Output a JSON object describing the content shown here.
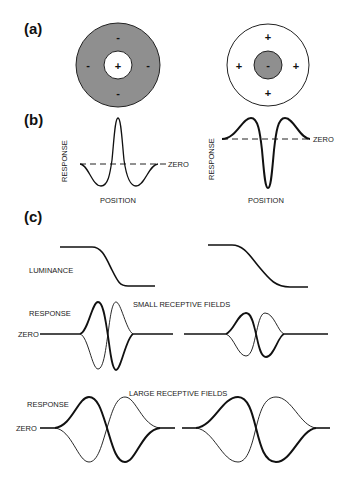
{
  "panels": {
    "a": {
      "label": "(a)",
      "left_field": {
        "description": "on-center off-surround",
        "center_sign": "+",
        "surround_signs": [
          "-",
          "-",
          "-",
          "-"
        ]
      },
      "right_field": {
        "description": "off-center on-surround",
        "center_sign": "-",
        "surround_signs": [
          "+",
          "+",
          "+",
          "+"
        ]
      }
    },
    "b": {
      "label": "(b)",
      "ylabel": "RESPONSE",
      "xlabel": "POSITION",
      "zero_label": "ZERO",
      "zero_label_right": "- ZERO"
    },
    "c": {
      "label": "(c)",
      "luminance_label": "LUMINANCE",
      "response_label": "RESPONSE",
      "zero_label": "ZERO",
      "small_title": "SMALL RECEPTIVE FIELDS",
      "large_title": "LARGE RECEPTIVE FIELDS"
    }
  },
  "colors": {
    "surround_fill": "#8f8f8f",
    "stroke": "#111111",
    "background": "#ffffff"
  }
}
